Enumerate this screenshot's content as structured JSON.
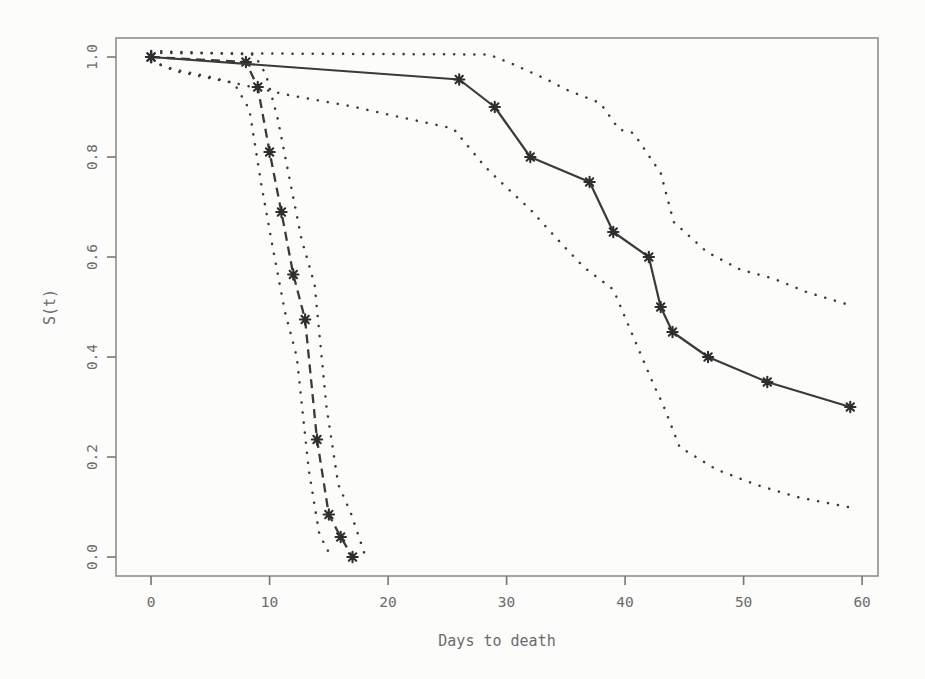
{
  "figure": {
    "kind": "scanned-survival-plot",
    "xlabel": "Days to death",
    "ylabel": "S(t)"
  },
  "colors": {
    "background": "#fcfcfa",
    "curve_ink": "#3a3a3a",
    "marker_ink": "#2e2e2e",
    "box_line": "#8e8e8e",
    "tick_line": "#757575",
    "label_text": "#6b6b6b"
  },
  "chart_data": {
    "type": "line",
    "title": "",
    "xlabel": "Days to death",
    "ylabel": "S(t)",
    "xlim": [
      -2.96,
      61.34
    ],
    "ylim": [
      -0.038,
      1.038
    ],
    "xticks": [
      0,
      10,
      20,
      30,
      40,
      50,
      60
    ],
    "xtick_labels": [
      "0",
      "10",
      "20",
      "30",
      "40",
      "50",
      "60"
    ],
    "yticks": [
      0.0,
      0.2,
      0.4,
      0.6,
      0.8,
      1.0
    ],
    "ytick_labels": [
      "0.0",
      "0.2",
      "0.4",
      "0.6",
      "0.8",
      "1.0"
    ],
    "grid": false,
    "legend": "none",
    "series": [
      {
        "name": "group1-ci-lower",
        "style": "dotted",
        "marker": "none",
        "points": [
          [
            0,
            0.99
          ],
          [
            2,
            0.975
          ],
          [
            5,
            0.96
          ],
          [
            7,
            0.948
          ],
          [
            8.3,
            0.895
          ],
          [
            9.3,
            0.745
          ],
          [
            10.3,
            0.615
          ],
          [
            11.3,
            0.49
          ],
          [
            12.3,
            0.4
          ],
          [
            13.3,
            0.175
          ],
          [
            14.2,
            0.045
          ],
          [
            15.2,
            0.0
          ]
        ]
      },
      {
        "name": "group1-ci-upper",
        "style": "dotted",
        "marker": "none",
        "points": [
          [
            0,
            1.012
          ],
          [
            8.7,
            1.005
          ],
          [
            9.7,
            0.965
          ],
          [
            10.7,
            0.875
          ],
          [
            11.7,
            0.755
          ],
          [
            12.7,
            0.635
          ],
          [
            13.8,
            0.545
          ],
          [
            14.8,
            0.3
          ],
          [
            15.8,
            0.145
          ],
          [
            16.9,
            0.085
          ],
          [
            18.1,
            0.0
          ]
        ]
      },
      {
        "name": "group2-ci-lower",
        "style": "dotted",
        "marker": "none",
        "points": [
          [
            0.8,
            0.985
          ],
          [
            2,
            0.972
          ],
          [
            7,
            0.948
          ],
          [
            12,
            0.922
          ],
          [
            17,
            0.901
          ],
          [
            20,
            0.885
          ],
          [
            25.5,
            0.857
          ],
          [
            28.2,
            0.78
          ],
          [
            29.5,
            0.75
          ],
          [
            32,
            0.695
          ],
          [
            34.5,
            0.63
          ],
          [
            36.5,
            0.58
          ],
          [
            39,
            0.535
          ],
          [
            41.5,
            0.395
          ],
          [
            42.5,
            0.34
          ],
          [
            43.2,
            0.305
          ],
          [
            44.6,
            0.22
          ],
          [
            47.7,
            0.175
          ],
          [
            51,
            0.145
          ],
          [
            54.5,
            0.12
          ],
          [
            58.8,
            0.1
          ]
        ]
      },
      {
        "name": "group2-ci-upper",
        "style": "dotted",
        "marker": "none",
        "points": [
          [
            0,
            1.008
          ],
          [
            28.5,
            1.005
          ],
          [
            30.6,
            0.985
          ],
          [
            33.4,
            0.955
          ],
          [
            35,
            0.935
          ],
          [
            37.9,
            0.908
          ],
          [
            39.5,
            0.855
          ],
          [
            40.7,
            0.848
          ],
          [
            43,
            0.768
          ],
          [
            44.1,
            0.67
          ],
          [
            46.9,
            0.61
          ],
          [
            49.7,
            0.575
          ],
          [
            52.5,
            0.557
          ],
          [
            55.3,
            0.53
          ],
          [
            58.8,
            0.505
          ]
        ]
      },
      {
        "name": "group1-survival",
        "style": "dashed",
        "marker": "asterisk",
        "points": [
          [
            0,
            1.0
          ],
          [
            8,
            0.99
          ],
          [
            9,
            0.94
          ],
          [
            10,
            0.81
          ],
          [
            11,
            0.69
          ],
          [
            12,
            0.565
          ],
          [
            13,
            0.475
          ],
          [
            14,
            0.235
          ],
          [
            15,
            0.085
          ],
          [
            16,
            0.04
          ],
          [
            17,
            0.0
          ]
        ]
      },
      {
        "name": "group2-survival",
        "style": "solid",
        "marker": "asterisk",
        "points": [
          [
            0,
            1.0
          ],
          [
            26,
            0.955
          ],
          [
            29,
            0.9
          ],
          [
            32,
            0.8
          ],
          [
            37,
            0.75
          ],
          [
            39,
            0.65
          ],
          [
            42,
            0.6
          ],
          [
            43,
            0.5
          ],
          [
            44,
            0.45
          ],
          [
            47,
            0.4
          ],
          [
            52,
            0.35
          ],
          [
            59,
            0.3
          ]
        ]
      }
    ]
  }
}
